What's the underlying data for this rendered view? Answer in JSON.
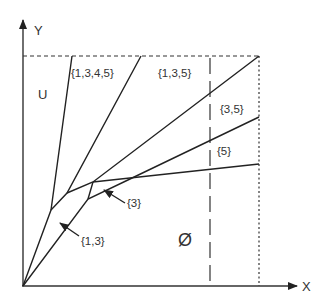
{
  "diagram": {
    "axes": {
      "x_label": "X",
      "y_label": "Y"
    },
    "regions": {
      "universal": "U",
      "empty": "Ø",
      "r1345": "{1,3,4,5}",
      "r135": "{1,3,5}",
      "r35": "{3,5}",
      "r5": "{5}",
      "r3": "{3}",
      "r13": "{1,3}"
    },
    "colors": {
      "line": "#222222",
      "text": "#333333",
      "background": "#ffffff"
    }
  }
}
